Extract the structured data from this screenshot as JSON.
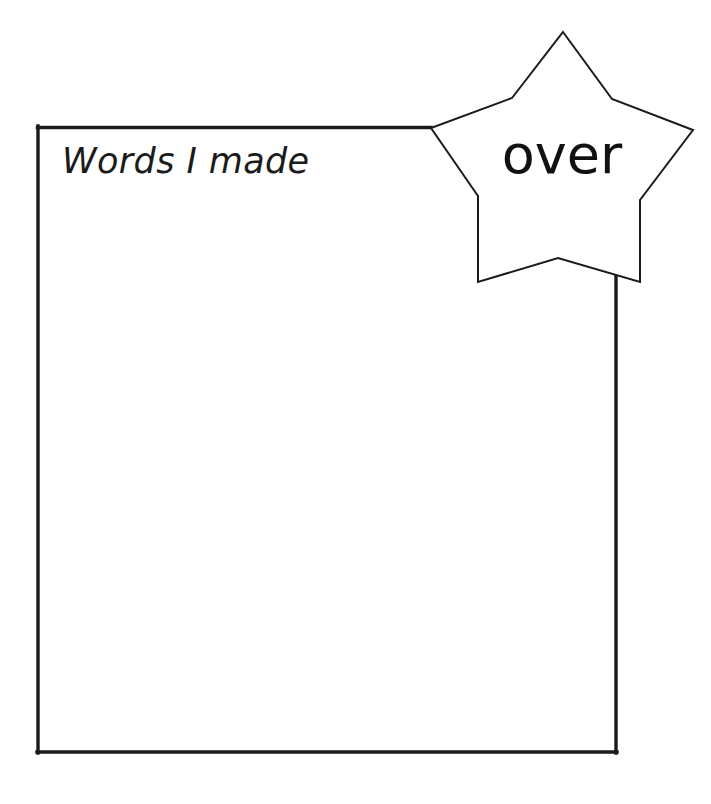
{
  "page": {
    "type": "worksheet",
    "background_color": "#ffffff",
    "ink_color": "#1a1a1a",
    "width": 711,
    "height": 804
  },
  "list_box": {
    "heading": "Words I made",
    "border_color": "#1a1a1a",
    "border_width": "3px",
    "fill": "#ffffff",
    "left": 37,
    "top": 126,
    "right": 616,
    "bottom": 753,
    "lines_count": 0
  },
  "star_badge": {
    "word": "over",
    "outline_color": "#1a1a1a",
    "fill": "#ffffff",
    "points": 5,
    "center_x": 562,
    "center_y": 157,
    "top_point_x": 563,
    "top_point_y": 32,
    "left_point_x": 431,
    "left_point_y": 128,
    "right_point_x": 693,
    "right_point_y": 130,
    "bottom_left_point_x": 478,
    "bottom_left_point_y": 282,
    "bottom_right_point_x": 640,
    "bottom_right_point_y": 282
  },
  "icons": {
    "star": "star-icon"
  }
}
